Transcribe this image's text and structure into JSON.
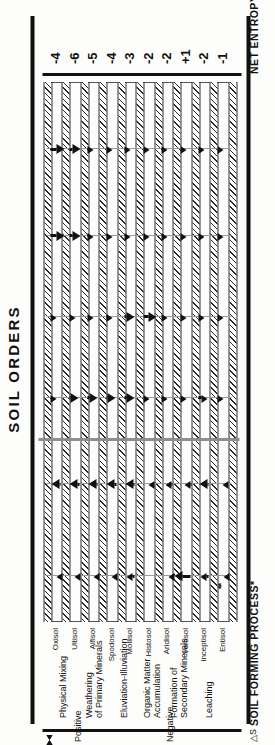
{
  "figure": {
    "title": "SOIL ORDERS",
    "process_header": "SOIL FORMING PROCESS*",
    "entropy_header": "NET ENTROPY CHANGE (△S)",
    "entropy_header_sup": "***",
    "delta_s_symbol": "△S",
    "sign_positive": "Positive",
    "sign_negative": "Negative",
    "footnote_marker": "**"
  },
  "processes": [
    {
      "id": "physical-mixing",
      "label": "Physical Mixing",
      "sign": "positive"
    },
    {
      "id": "weathering-primary-minerals",
      "label": "Weathering\nof Primary Minerals",
      "line1": "Weathering",
      "line2": "of Primary Minerals",
      "sign": "positive"
    },
    {
      "id": "eluviation-illuviation",
      "label": "Eluviation-Illuviation",
      "line1": "Eluviation-Illuviation",
      "line2": "",
      "sign": "negative"
    },
    {
      "id": "organic-matter-accumulation",
      "label": "Organic Matter\nAccumulation",
      "line1": "Organic Matter",
      "line2": "Accumulation",
      "sign": "negative"
    },
    {
      "id": "formation-secondary-minerals",
      "label": "Formation of\nSecondary Minerals",
      "line1": "Formation of",
      "line2": "Secondary Minerals",
      "sign": "negative"
    },
    {
      "id": "leaching",
      "label": "Leaching",
      "line1": "Leaching",
      "line2": "",
      "sign": "negative"
    }
  ],
  "chart_data": {
    "type": "bar",
    "title": "SOIL ORDERS",
    "xlabel": "SOIL FORMING PROCESS*",
    "ylabel": "NET ENTROPY CHANGE (△S)***",
    "grid": true,
    "legend": "none",
    "categories": [
      "Oxisol",
      "Ultisol",
      "Alfisol",
      "Spodosol",
      "Mollisol",
      "Histosol",
      "Aridisol",
      "Vertisol",
      "Inceptisol",
      "Entisol"
    ],
    "series": [
      {
        "name": "Physical Mixing",
        "sign": "positive",
        "values": [
          0.3,
          0.3,
          0.3,
          0.3,
          0.55,
          0.0,
          0.22,
          1.0,
          0.55,
          0.18
        ]
      },
      {
        "name": "Weathering of Primary Minerals",
        "sign": "positive",
        "values": [
          0.62,
          0.62,
          0.62,
          0.62,
          0.62,
          0.3,
          0.42,
          0.4,
          0.6,
          0.3
        ]
      },
      {
        "name": "Eluviation-Illuviation",
        "sign": "negative",
        "values": [
          0.3,
          0.6,
          0.6,
          0.6,
          0.6,
          0.1,
          0.38,
          0.1,
          0.55,
          0.08
        ]
      },
      {
        "name": "Organic Matter Accumulation",
        "sign": "negative",
        "values": [
          0.22,
          0.22,
          0.3,
          0.4,
          0.62,
          0.85,
          0.3,
          0.35,
          0.35,
          0.3
        ]
      },
      {
        "name": "Formation of Secondary Minerals",
        "sign": "negative",
        "values": [
          0.85,
          0.7,
          0.4,
          0.42,
          0.35,
          0.22,
          0.38,
          0.18,
          0.25,
          0.12
        ]
      },
      {
        "name": "Leaching",
        "sign": "negative",
        "values": [
          0.85,
          0.7,
          0.4,
          0.3,
          0.3,
          0.12,
          0.15,
          0.12,
          0.25,
          0.15
        ]
      }
    ],
    "net_entropy_change": [
      -4,
      -6,
      -5,
      -4,
      -3,
      -2,
      -2,
      1,
      -2,
      -1
    ],
    "net_entropy_change_labels": [
      "-4",
      "-6",
      "-5",
      "-4",
      "-3",
      "-2",
      "-2",
      "+1",
      "-2",
      "-1"
    ]
  },
  "soil_orders": [
    {
      "name": "Oxisol",
      "value": "-4"
    },
    {
      "name": "Ultisol",
      "value": "-6"
    },
    {
      "name": "Alfisol",
      "value": "-5"
    },
    {
      "name": "Spodosol",
      "value": "-4"
    },
    {
      "name": "Mollisol",
      "value": "-3"
    },
    {
      "name": "Histosol",
      "value": "-2"
    },
    {
      "name": "Aridisol",
      "value": "-2"
    },
    {
      "name": "Vertisol",
      "value": "+1"
    },
    {
      "name": "Inceptisol",
      "value": "-2"
    },
    {
      "name": "Entisol",
      "value": "-1"
    }
  ]
}
